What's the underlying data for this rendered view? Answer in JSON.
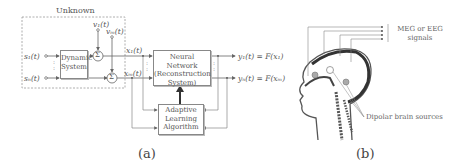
{
  "panel_a": {
    "unknown_label": "Unknown",
    "inputs": [
      "s₁(t)",
      "sₙ(t)"
    ],
    "noise": [
      "v₁(t)",
      "vₘ(t)"
    ],
    "dynamic_system": [
      "Dynamic",
      "System"
    ],
    "sum_symbol": "Σ",
    "mixtures": [
      "x₁(t)",
      "xₘ(t)"
    ],
    "neural_network": [
      "Neural Network",
      "(Reconstruction",
      "System)"
    ],
    "outputs": [
      "y₁(t) = F(x₁)",
      "yₙ(t) = F(xₘ)"
    ],
    "adaptive": [
      "Adaptive",
      "Learning",
      "Algorithm"
    ],
    "caption": "(a)"
  },
  "panel_b": {
    "signals_label": [
      "MEG or EEG",
      "signals"
    ],
    "sources_label": "Dipolar brain sources",
    "caption": "(b)"
  }
}
